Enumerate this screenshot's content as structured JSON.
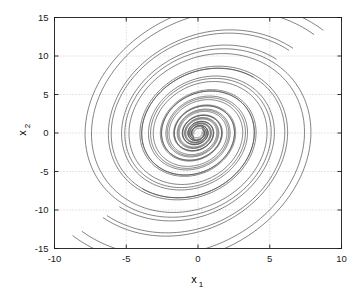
{
  "chart_data": {
    "type": "line",
    "title": "",
    "subtitle": "",
    "xlabel": "x_1",
    "xlabel_base": "x",
    "xlabel_sub": "1",
    "ylabel": "x_2",
    "ylabel_base": "x",
    "ylabel_sub": "2",
    "xlim": [
      -10,
      10
    ],
    "ylim": [
      -15,
      15
    ],
    "xticks": [
      -10,
      -5,
      0,
      5,
      10
    ],
    "xtick_labels": [
      "-10",
      "-5",
      "0",
      "5",
      "10"
    ],
    "yticks": [
      -15,
      -10,
      -5,
      0,
      5,
      10,
      15
    ],
    "ytick_labels": [
      "-15",
      "-10",
      "-5",
      "0",
      "5",
      "10",
      "15"
    ],
    "grid": true,
    "grid_style": "dotted",
    "grid_color": "#bfbfbf",
    "legend": "none",
    "line_color": "#4d4d4d",
    "line_width": 0.7,
    "axis_color": "#1a1a1a",
    "background": "#ffffff",
    "spiral": {
      "center": [
        0,
        0
      ],
      "direction": "counterclockwise-inward",
      "decay_per_turn": 0.42,
      "turns": 3.6
    },
    "series": [
      {
        "name": "trajectory-1",
        "start": [
          -9.0,
          -10.0
        ],
        "r0": 13.45,
        "theta0": 4.0,
        "decay": 0.42,
        "turns": 3.55
      },
      {
        "name": "trajectory-2",
        "start": [
          -8.2,
          -10.0
        ],
        "r0": 12.65,
        "theta0": 4.02,
        "decay": 0.42,
        "turns": 3.55
      },
      {
        "name": "trajectory-3",
        "start": [
          -6.2,
          -10.0
        ],
        "r0": 10.6,
        "theta0": 4.05,
        "decay": 0.42,
        "turns": 3.5
      },
      {
        "name": "trajectory-4",
        "start": [
          -5.7,
          -10.0
        ],
        "r0": 10.25,
        "theta0": 4.06,
        "decay": 0.42,
        "turns": 3.5
      },
      {
        "name": "trajectory-5",
        "start": [
          -4.6,
          -10.0
        ],
        "r0": 9.0,
        "theta0": 4.08,
        "decay": 0.42,
        "turns": 3.45
      },
      {
        "name": "trajectory-6",
        "start": [
          -3.3,
          -10.0
        ],
        "r0": 6.6,
        "theta0": 4.12,
        "decay": 0.42,
        "turns": 3.4
      },
      {
        "name": "trajectory-7",
        "start": [
          9.0,
          10.0
        ],
        "r0": 13.45,
        "theta0": 0.86,
        "decay": 0.42,
        "turns": 3.55
      },
      {
        "name": "trajectory-8",
        "start": [
          8.2,
          10.0
        ],
        "r0": 12.65,
        "theta0": 0.88,
        "decay": 0.42,
        "turns": 3.55
      },
      {
        "name": "trajectory-9",
        "start": [
          6.2,
          10.0
        ],
        "r0": 10.6,
        "theta0": 0.91,
        "decay": 0.42,
        "turns": 3.5
      },
      {
        "name": "trajectory-10",
        "start": [
          5.7,
          10.0
        ],
        "r0": 10.25,
        "theta0": 0.92,
        "decay": 0.42,
        "turns": 3.5
      },
      {
        "name": "trajectory-11",
        "start": [
          4.6,
          10.0
        ],
        "r0": 9.0,
        "theta0": 0.94,
        "decay": 0.42,
        "turns": 3.45
      },
      {
        "name": "trajectory-12",
        "start": [
          3.3,
          10.0
        ],
        "r0": 6.6,
        "theta0": 0.98,
        "decay": 0.42,
        "turns": 3.4
      }
    ]
  }
}
